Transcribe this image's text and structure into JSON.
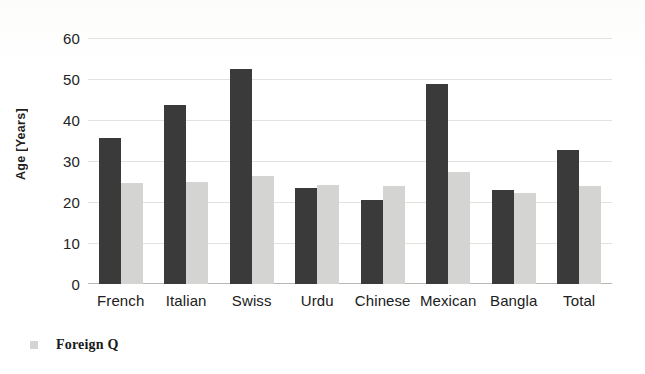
{
  "chart_data": {
    "type": "bar",
    "title": "",
    "subtitle": "",
    "xlabel": "",
    "ylabel": "Age [Years]",
    "ylim": [
      0,
      60
    ],
    "ytick_step": 10,
    "yticks": [
      0,
      10,
      20,
      30,
      40,
      50,
      60
    ],
    "grid": true,
    "grid_axis": "y",
    "legend_position": "bottom-left",
    "categories": [
      "French",
      "Italian",
      "Swiss",
      "Urdu",
      "Chinese",
      "Mexican",
      "Bangla",
      "Total"
    ],
    "series": [
      {
        "name": "",
        "legend_visible": false,
        "color": "#3a3a3a",
        "values": [
          35.7,
          43.6,
          52.5,
          23.4,
          20.6,
          48.8,
          23.0,
          32.7
        ]
      },
      {
        "name": "Foreign Q",
        "legend_visible": true,
        "color": "#d4d4d2",
        "values": [
          24.6,
          25.0,
          26.3,
          24.1,
          23.8,
          27.3,
          22.3,
          23.9
        ]
      }
    ]
  },
  "legend": {
    "items": [
      {
        "label": "Foreign Q",
        "marker": "square-swatch",
        "color": "#d4d4d2"
      }
    ]
  },
  "axis": {
    "y_title": "Age [Years]",
    "y_tick_labels": [
      "60",
      "50",
      "40",
      "30",
      "20",
      "10",
      "0"
    ],
    "x_tick_labels": [
      "French",
      "Italian",
      "Swiss",
      "Urdu",
      "Chinese",
      "Mexican",
      "Bangla",
      "Total"
    ]
  },
  "colors": {
    "series_primary": "#3a3a3a",
    "series_secondary": "#d4d4d2",
    "gridline": "#e2e2de",
    "axis_line": "#b9b9b4",
    "text": "#202020",
    "background": "#ffffff"
  }
}
